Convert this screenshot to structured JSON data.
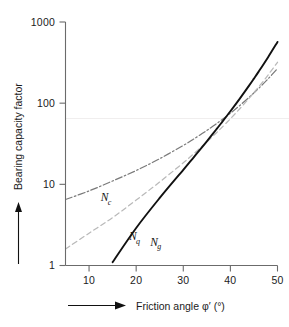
{
  "chart_data": {
    "type": "line",
    "title": "",
    "xlabel": "Friction angle φ′ (°)",
    "ylabel": "Bearing capacity factor",
    "xlim": [
      5,
      50
    ],
    "ylim": [
      1,
      1000
    ],
    "yscale": "log",
    "xticks": [
      10,
      20,
      30,
      40,
      50
    ],
    "xtick_labels": [
      "10",
      "20",
      "30",
      "40",
      "50"
    ],
    "yticks": [
      1,
      10,
      100,
      1000
    ],
    "ytick_labels": [
      "1",
      "10",
      "100",
      "1000"
    ],
    "grid": false,
    "legend": "inline-curve-labels",
    "x": [
      5,
      10,
      15,
      20,
      25,
      30,
      32,
      34,
      35,
      36,
      37,
      38,
      40,
      42,
      44,
      45,
      46,
      48,
      50
    ],
    "series": [
      {
        "name": "Nc",
        "label": "N",
        "subscript": "c",
        "style": "dash-dot",
        "color": "#7a7a7a",
        "label_x": 12.5,
        "label_y": 6.2,
        "values": [
          6.5,
          8.3,
          11.0,
          14.8,
          20.7,
          30.1,
          35.5,
          42.2,
          46.1,
          50.6,
          55.6,
          61.4,
          75.3,
          93.7,
          118.4,
          133.9,
          152.1,
          199.3,
          266.9
        ]
      },
      {
        "name": "Nq",
        "label": "N",
        "subscript": "q",
        "style": "dashed",
        "color": "#b9b9b9",
        "label_x": 18.5,
        "label_y": 2.05,
        "values": [
          1.6,
          2.5,
          3.9,
          6.4,
          10.7,
          18.4,
          23.2,
          29.4,
          33.3,
          37.8,
          42.9,
          48.9,
          64.2,
          85.4,
          115.3,
          134.9,
          158.5,
          222.3,
          319.1
        ]
      },
      {
        "name": "Ng",
        "label": "N",
        "subscript": "g",
        "style": "solid",
        "color": "#111111",
        "label_x": 23.0,
        "label_y": 1.75,
        "values": [
          null,
          null,
          1.1,
          2.9,
          6.8,
          15.1,
          20.8,
          28.8,
          33.9,
          40.1,
          47.4,
          56.2,
          79.5,
          113.9,
          165.6,
          200.8,
          244.6,
          368.7,
          568.5
        ]
      }
    ],
    "notes": {
      "ng_x_intercept": 14.5,
      "ng_top_value": 900
    }
  },
  "axis": {
    "x_axis_name": "x-axis",
    "y_axis_name": "y-axis",
    "x_arrow": "right-arrow",
    "y_arrow": "up-arrow"
  }
}
